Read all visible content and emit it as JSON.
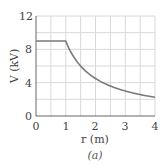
{
  "chart_data": {
    "type": "line",
    "title": "",
    "caption": "(a)",
    "xlabel": "r (m)",
    "ylabel": "V (kV)",
    "xlim": [
      0,
      4
    ],
    "ylim": [
      0,
      12
    ],
    "xticks": [
      0,
      1,
      2,
      3,
      4
    ],
    "yticks": [
      0,
      4,
      8,
      12
    ],
    "grid": true,
    "grid_x_step": 0.5,
    "grid_y_step": 2,
    "series": [
      {
        "name": "V(r)",
        "description": "Constant 9 kV for r <= 1 m, then 9/r kV for r > 1 m",
        "x": [
          0,
          0.5,
          1.0,
          1.25,
          1.5,
          1.75,
          2.0,
          2.5,
          3.0,
          3.5,
          4.0
        ],
        "y": [
          9,
          9,
          9,
          7.2,
          6.0,
          5.14,
          4.5,
          3.6,
          3.0,
          2.57,
          2.25
        ]
      }
    ],
    "colors": {
      "line": "#7a7a7a",
      "grid": "#d8d8d8",
      "axis": "#666666"
    }
  },
  "labels": {
    "x_axis": "r (m)",
    "y_axis": "V (kV)",
    "caption": "(a)",
    "xticks": [
      "0",
      "1",
      "2",
      "3",
      "4"
    ],
    "yticks": [
      "0",
      "4",
      "8",
      "12"
    ]
  }
}
